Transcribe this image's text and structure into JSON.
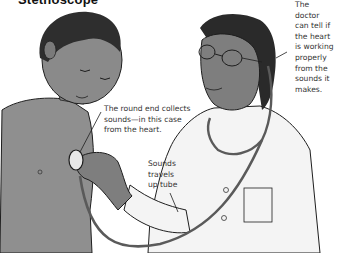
{
  "title": "Stethoscope",
  "labels": {
    "doctor": [
      "The",
      "doctor",
      "can tell if",
      "the heart",
      "is working",
      "properly",
      "from the",
      "sounds it",
      "makes."
    ],
    "round_end": [
      "The round end collects",
      "sounds—in this case",
      "from the heart."
    ],
    "tube": [
      "Sounds",
      "travels",
      "up tube"
    ]
  },
  "colors": {
    "skin": "#8a8a8a",
    "skin_shadow": "#6e6e6e",
    "hair": "#2a2a2a",
    "coat": "#f4f4f4",
    "tube": "#5a5a5a",
    "line": "#1e1e1e"
  }
}
